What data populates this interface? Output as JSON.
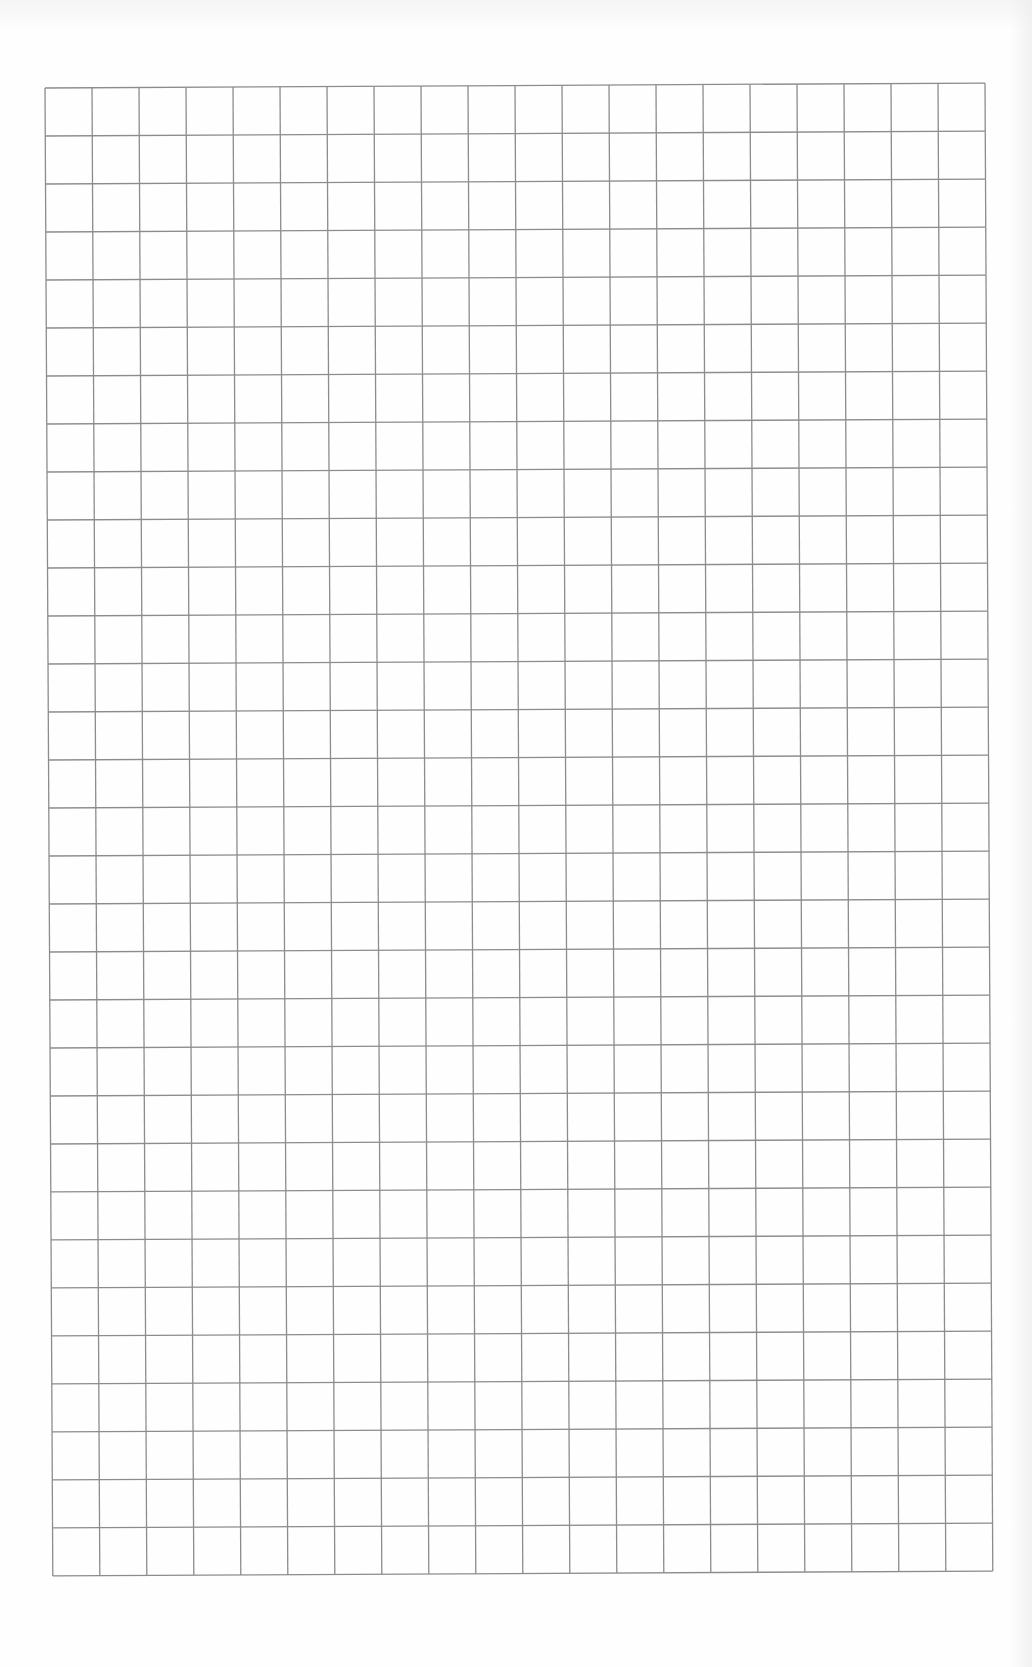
{
  "page": {
    "type": "blank graph paper scan",
    "background_color": "#fefefe",
    "grid": {
      "columns": 20,
      "rows": 31,
      "cell_width_px": 47,
      "cell_height_px": 48,
      "line_color": "#8c8c8c",
      "line_width_px": 1.3,
      "origin": {
        "x": 43,
        "y": 86
      },
      "rotation_deg": -0.3
    }
  }
}
